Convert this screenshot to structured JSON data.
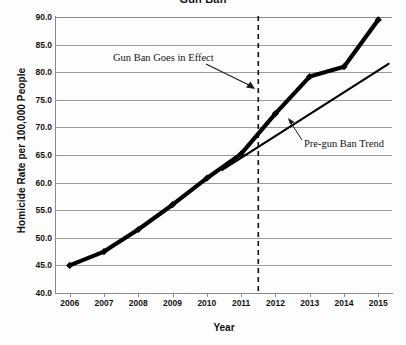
{
  "chart_data": {
    "type": "line",
    "title": "Gun Ban",
    "xlabel": "Year",
    "ylabel": "Homicide Rate per 100,000 People",
    "categories": [
      "2006",
      "2007",
      "2008",
      "2009",
      "2010",
      "2011",
      "2012",
      "2013",
      "2014",
      "2015"
    ],
    "x": [
      2006,
      2007,
      2008,
      2009,
      2010,
      2011,
      2012,
      2013,
      2014,
      2015
    ],
    "xlim": [
      2005.6,
      2015.4
    ],
    "ylim": [
      40.0,
      90.0
    ],
    "yticks": [
      "90.0",
      "85.0",
      "80.0",
      "75.0",
      "70.0",
      "65.0",
      "60.0",
      "55.0",
      "50.0",
      "45.0",
      "40.0"
    ],
    "ytick_values": [
      90.0,
      85.0,
      80.0,
      75.0,
      70.0,
      65.0,
      60.0,
      55.0,
      50.0,
      45.0,
      40.0
    ],
    "grid": true,
    "legend": "none",
    "series": [
      {
        "name": "Homicide Rate",
        "style": "thick-line-with-diamond-markers",
        "color": "#000000",
        "values": [
          45.0,
          47.5,
          51.5,
          56.0,
          60.8,
          65.2,
          72.5,
          79.2,
          81.0,
          89.5
        ]
      },
      {
        "name": "Pre-gun Ban Trend",
        "style": "thin-straight-line",
        "color": "#000000",
        "x": [
          2010.45,
          2015.3
        ],
        "values": [
          62.3,
          81.5
        ]
      }
    ],
    "annotations": [
      {
        "name": "gun-ban-goes-in-effect",
        "text": "Gun Ban Goes in Effect",
        "arrow": true,
        "points_to": "vertical-dashed-line at 2011.5"
      },
      {
        "name": "pre-gun-ban-trend",
        "text": "Pre-gun Ban Trend",
        "arrow": true,
        "points_to": "trend line"
      }
    ],
    "reference_lines": [
      {
        "name": "gun-ban-effective-date",
        "orientation": "vertical",
        "x": 2011.5,
        "style": "dashed"
      }
    ]
  }
}
